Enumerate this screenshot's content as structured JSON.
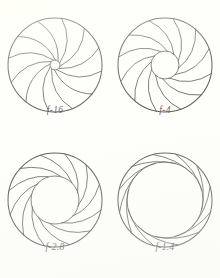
{
  "figure": {
    "type": "technical-illustration",
    "background_color": "#fffffc",
    "line_color": "#262626",
    "blade_count": 12,
    "columns": 2,
    "rows": 2,
    "apertures": [
      {
        "id": "aperture-f16",
        "label": "f-16",
        "f_number": 16,
        "position": "top-left",
        "barrel_radius_px": 47,
        "opening_radius_px": 5,
        "opening_relative": 0.11,
        "description": "smallest opening, blades almost fully closed, twelve blade edges converge to a tiny circular hole",
        "blade_rotation_deg": 8,
        "center": {
          "x": 55,
          "y": 65
        }
      },
      {
        "id": "aperture-f4",
        "label": "f-4",
        "f_number": 4,
        "position": "top-right",
        "barrel_radius_px": 47,
        "opening_radius_px": 14,
        "opening_relative": 0.3,
        "description": "moderately small opening, twelve blades form a rounded polygon hole",
        "blade_rotation_deg": 10,
        "center": {
          "x": 55,
          "y": 65
        }
      },
      {
        "id": "aperture-f28",
        "label": "f-2.8",
        "f_number": 2.8,
        "position": "bottom-left",
        "barrel_radius_px": 47,
        "opening_radius_px": 24,
        "opening_relative": 0.51,
        "description": "large opening, blades retracted toward the barrel leaving a wide rounded aperture",
        "blade_rotation_deg": 12,
        "center": {
          "x": 55,
          "y": 65
        }
      },
      {
        "id": "aperture-f14",
        "label": "f-1.4",
        "f_number": 1.4,
        "position": "bottom-right",
        "barrel_radius_px": 47,
        "opening_radius_px": 38,
        "opening_relative": 0.81,
        "description": "widest opening, blades stacked into a thin ring against the barrel wall",
        "blade_rotation_deg": 14,
        "center": {
          "x": 55,
          "y": 65
        }
      }
    ]
  }
}
